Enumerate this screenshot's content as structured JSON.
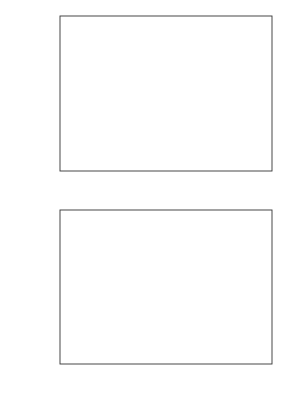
{
  "chart_data": [
    {
      "type": "line",
      "panel": "top",
      "title": "",
      "xlabel": "",
      "ylabel": "σ²_{h_f}",
      "ylabel_base": "σ",
      "ylabel_sup": "2",
      "ylabel_sub": "h",
      "ylabel_subsub": "f",
      "xlim": [
        0.0,
        1.0
      ],
      "ylim": [
        0.0,
        2.0
      ],
      "xticks": [
        "0.0",
        "0.2",
        "0.4",
        "0.6",
        "0.8",
        "1.0"
      ],
      "yticks": [
        "0.0",
        "0.5",
        "1.0",
        "1.5",
        "2.0"
      ],
      "grid": false,
      "legend_position": "upper right",
      "legend": [
        {
          "label": "t = 0.01",
          "prefix": "t",
          "value": "=0.01",
          "marker": "circle-filled",
          "line": "solid"
        },
        {
          "label": "t = 0.06",
          "prefix": "t",
          "value": "=0.06",
          "marker": "triangle-down-open",
          "line": "dashed"
        },
        {
          "label": "t = 0.56",
          "prefix": "t",
          "value": "=0.56",
          "marker": "square-filled",
          "line": "solid"
        },
        {
          "label": "t = 1.50",
          "prefix": "t",
          "value": "=1.50",
          "marker": "diamond-open",
          "line": "dashed"
        }
      ],
      "series": [
        {
          "name": "t=0.01",
          "marker": "circle-filled",
          "line": "solid",
          "x": [
            0.0,
            0.1,
            0.2,
            0.3,
            0.4,
            0.5,
            0.6,
            0.7,
            0.8,
            0.9,
            1.0
          ],
          "y": [
            0.0,
            0.44,
            0.85,
            0.99,
            1.01,
            0.95,
            0.86,
            0.73,
            0.54,
            0.25,
            0.0
          ]
        },
        {
          "name": "t=0.06",
          "marker": "triangle-down-open",
          "line": "dashed",
          "x": [
            0.0,
            0.1,
            0.2,
            0.3,
            0.4,
            0.5,
            0.6,
            0.7,
            0.8,
            0.9,
            1.0
          ],
          "y": [
            0.0,
            0.44,
            0.85,
            0.99,
            1.0,
            0.94,
            0.86,
            0.73,
            0.54,
            0.25,
            0.0
          ]
        },
        {
          "name": "t=0.56",
          "marker": "square-filled",
          "line": "solid",
          "x": [
            0.0,
            0.1,
            0.2,
            0.3,
            0.4,
            0.5,
            0.6,
            0.7,
            0.8,
            0.9,
            1.0
          ],
          "y": [
            0.0,
            0.44,
            0.85,
            0.99,
            0.99,
            0.93,
            0.85,
            0.72,
            0.54,
            0.25,
            0.0
          ]
        },
        {
          "name": "t=1.50",
          "marker": "diamond-open",
          "line": "dashed",
          "x": [
            0.0,
            0.05,
            0.15,
            0.25,
            0.35,
            0.45,
            0.55,
            0.65,
            0.75,
            0.85,
            0.95,
            1.0
          ],
          "y": [
            0.0,
            0.17,
            0.68,
            0.95,
            1.02,
            0.99,
            0.91,
            0.8,
            0.64,
            0.4,
            0.09,
            0.0
          ]
        }
      ]
    },
    {
      "type": "line",
      "panel": "bottom",
      "title": "",
      "xlabel": "x_1",
      "xlabel_base": "x",
      "xlabel_sub": "1",
      "ylabel": "σ²_{h_m}",
      "ylabel_base": "σ",
      "ylabel_sup": "2",
      "ylabel_sub": "h",
      "ylabel_subsub": "m",
      "xlim": [
        0.0,
        1.0
      ],
      "ylim": [
        0.0,
        0.15
      ],
      "xticks": [
        "0.0",
        "0.2",
        "0.4",
        "0.6",
        "0.8",
        "1.0"
      ],
      "yticks": [
        "0.00",
        "0.05",
        "0.10",
        "0.15"
      ],
      "grid": false,
      "series": [
        {
          "name": "t=0.01",
          "marker": "circle-filled",
          "line": "solid",
          "x": [
            0.0,
            0.1,
            0.2,
            0.3,
            0.4,
            0.5,
            0.6,
            0.7,
            0.8,
            0.85,
            0.9,
            1.0
          ],
          "y": [
            0.0,
            0.029,
            0.018,
            0.006,
            0.001,
            0.0005,
            0.002,
            0.012,
            0.04,
            0.061,
            0.066,
            0.0
          ]
        },
        {
          "name": "t=0.06",
          "marker": "triangle-down-open",
          "line": "dashed",
          "x": [
            0.0,
            0.15,
            0.2,
            0.3,
            0.4,
            0.5,
            0.6,
            0.7,
            0.8,
            0.9,
            1.0
          ],
          "y": [
            0.0,
            0.027,
            0.025,
            0.025,
            0.024,
            0.025,
            0.031,
            0.039,
            0.044,
            0.03,
            0.0
          ]
        },
        {
          "name": "t=0.56",
          "marker": "square-filled",
          "line": "solid",
          "x": [
            0.0,
            0.1,
            0.2,
            0.3,
            0.4,
            0.5,
            0.6,
            0.7,
            0.8,
            0.9,
            1.0
          ],
          "y": [
            0.0,
            0.016,
            0.035,
            0.048,
            0.055,
            0.058,
            0.056,
            0.05,
            0.038,
            0.017,
            0.0
          ]
        },
        {
          "name": "t=1.50",
          "marker": "diamond-open",
          "line": "dashed",
          "x": [
            0.0,
            0.05,
            0.15,
            0.25,
            0.35,
            0.45,
            0.55,
            0.65,
            0.75,
            0.85,
            0.95,
            1.0
          ],
          "y": [
            0.0,
            0.005,
            0.027,
            0.042,
            0.052,
            0.058,
            0.059,
            0.054,
            0.044,
            0.027,
            0.006,
            0.0
          ]
        }
      ]
    }
  ],
  "colors": {
    "ink": "#1a1a1a",
    "frame": "#333333",
    "background": "#ffffff"
  }
}
